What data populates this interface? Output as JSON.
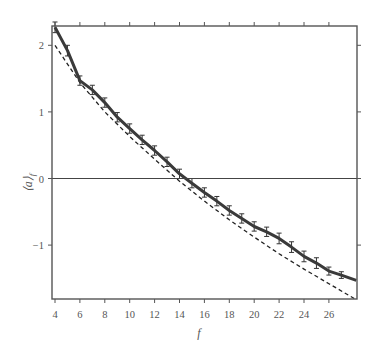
{
  "chart_data": {
    "type": "line",
    "title": "",
    "xlabel": "f",
    "ylabel": "⟨a⟩_f",
    "xlim": [
      3.8,
      28.2
    ],
    "ylim": [
      -1.81,
      2.29
    ],
    "grid": false,
    "legend": null,
    "x_ticks": [
      4,
      6,
      8,
      10,
      12,
      14,
      16,
      18,
      20,
      22,
      24,
      26
    ],
    "y_ticks": [
      -1,
      0,
      1,
      2
    ],
    "reference_line": {
      "y": 0,
      "style": "solid-thin"
    },
    "series": [
      {
        "name": "measured",
        "style": "solid-thick-with-errorbars",
        "color": "#3a3a3a",
        "x": [
          4,
          5,
          6,
          7,
          8,
          9,
          10,
          11,
          12,
          13,
          14,
          15,
          16,
          17,
          18,
          19,
          20,
          21,
          22,
          23,
          24,
          25,
          26,
          27,
          28.2
        ],
        "values": [
          2.27,
          1.92,
          1.47,
          1.33,
          1.14,
          0.92,
          0.75,
          0.58,
          0.42,
          0.25,
          0.07,
          -0.07,
          -0.21,
          -0.34,
          -0.48,
          -0.6,
          -0.72,
          -0.8,
          -0.9,
          -1.03,
          -1.17,
          -1.27,
          -1.39,
          -1.45,
          -1.53
        ],
        "errors": [
          0.08,
          0.08,
          0.07,
          0.07,
          0.07,
          0.07,
          0.07,
          0.07,
          0.07,
          0.07,
          0.07,
          0.07,
          0.07,
          0.07,
          0.07,
          0.07,
          0.07,
          0.07,
          0.08,
          0.08,
          0.08,
          0.08,
          0.06,
          0.05,
          0
        ]
      },
      {
        "name": "theory",
        "style": "dashed",
        "color": "#222222",
        "x": [
          4,
          6,
          8,
          10,
          12,
          14,
          16,
          18,
          20,
          22,
          24,
          26,
          28.2
        ],
        "values": [
          2.0,
          1.44,
          1.0,
          0.63,
          0.29,
          -0.04,
          -0.34,
          -0.62,
          -0.88,
          -1.13,
          -1.36,
          -1.58,
          -1.82
        ]
      }
    ]
  }
}
